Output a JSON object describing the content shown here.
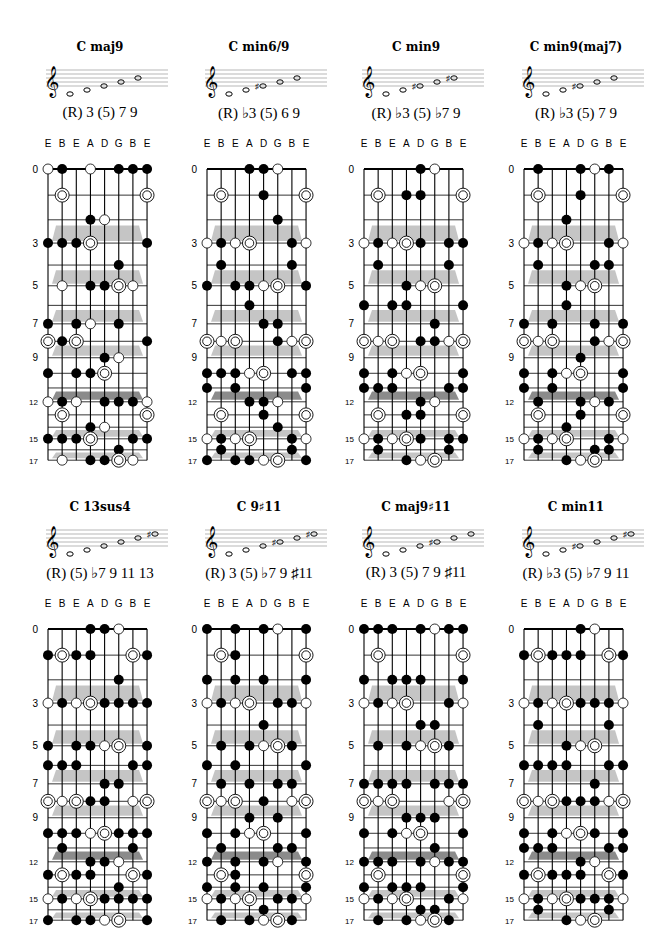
{
  "tuning": [
    "E",
    "B",
    "E",
    "A",
    "D",
    "G",
    "B",
    "E"
  ],
  "fret_labels": [
    0,
    3,
    5,
    7,
    9,
    12,
    15,
    17
  ],
  "legend": {
    "f": "filled-dot",
    "o": "open-circle",
    "r": "root-double-ring"
  },
  "charts": [
    {
      "title": "C maj9",
      "formula": "(R) 3 (5) 7 9",
      "notes": [
        0,
        1,
        2,
        3,
        4
      ],
      "acc": [
        0,
        0,
        0,
        0,
        0
      ],
      "dots": {
        "0": "of.o.fffo",
        "1": ".r.....r.",
        "2": "...fo....",
        "3": "fffr...ff",
        "4": ".....f...",
        "5": ".o.ffro..",
        "7": "f.fo.f..f",
        "8": "rfr....fr",
        "9": "....fo...",
        "10": "f.ffr...f",
        "12": "ofo.fffo",
        "13": ".r.....r",
        "14": "...fo...",
        "15": "fffr..ff",
        "16": ".....f..",
        "17": ".o.ffro."
      }
    },
    {
      "title": "C min6/9",
      "formula": "(R) ♭3 (5) 6 9",
      "notes": [
        0,
        1,
        2,
        3,
        4
      ],
      "acc": [
        0,
        0,
        1,
        0,
        0
      ],
      "dots": {
        "0": "...ffo..",
        "1": ".r..f..r",
        "2": ".....f..",
        "3": "ofor..fo",
        "4": ".f....f.",
        "5": "f.ffor.f",
        "6": "...f....",
        "7": "....ff..",
        "8": "ror..fo r",
        "10": "fffor.ff",
        "11": "f.f....f",
        "12": "...ffo..",
        "13": ".r..f..r",
        "14": ".....f..",
        "15": "ofor..fo",
        "16": ".f....f.",
        "17": "f.ffor.f"
      }
    },
    {
      "title": "C min9",
      "formula": "(R) ♭3 (5) ♭7 9",
      "notes": [
        0,
        1,
        2,
        3,
        4
      ],
      "acc": [
        0,
        0,
        1,
        0,
        1
      ],
      "dots": {
        "0": "....fo..",
        "1": ".r.ff..r",
        "3": "oforf.ffo",
        "4": ".f....f.",
        "5": "...for..",
        "6": "f.f f...f",
        "7": ".....f..",
        "8": "ror.ffor",
        "10": "f.for..f",
        "11": "fff...ff",
        "12": "....fo..",
        "13": ".r.ff..r",
        "15": "oforf.ffo",
        "16": ".f....f.",
        "17": "...for.."
      }
    },
    {
      "title": "C min9(maj7)",
      "formula": "(R) ♭3 (5) 7 9",
      "notes": [
        0,
        1,
        2,
        3,
        4
      ],
      "acc": [
        0,
        0,
        1,
        0,
        0
      ],
      "dots": {
        "0": ".f..fof.",
        "1": ".r..f..r",
        "2": "...f....",
        "3": "ofor..fo",
        "4": ".f...ff.",
        "5": "...for..",
        "6": "...f....",
        "7": "f.f..f.f",
        "8": "ror..for",
        "9": "....f...",
        "10": "f.for..f",
        "11": "f.f....f",
        "12": ".f..fof.",
        "13": ".r..f..r",
        "14": "...f....",
        "15": "ofor..fo",
        "16": ".f...ff.",
        "17": "...for.."
      }
    },
    {
      "title": "C 13sus4",
      "formula": "(R) (5) ♭7 9 11 13",
      "notes": [
        0,
        1,
        2,
        3,
        4,
        5
      ],
      "acc": [
        0,
        0,
        0,
        0,
        0,
        1
      ],
      "dots": {
        "0": "...ffo..",
        "1": "frff..rf",
        "2": ".....f..",
        "3": "oforffffo",
        "5": "f.ffor.f",
        "6": "fff...ff",
        "7": "....ff..",
        "8": "rorff.or",
        "10": "fffor fff",
        "11": ".f....f.",
        "12": "...ffo..",
        "13": "frff..rf",
        "14": ".....f..",
        "15": "oforffffo",
        "17": "f.ffor.f"
      }
    },
    {
      "title": "C 9♯11",
      "formula": "(R) 3 (5) ♭7 9 ♯11",
      "notes": [
        0,
        1,
        2,
        3,
        4,
        5
      ],
      "acc": [
        0,
        0,
        0,
        1,
        0,
        1
      ],
      "dots": {
        "0": "f.f.fo.f",
        "1": ".rf....r",
        "2": "f.f.f..f",
        "3": "ofor.ffo",
        "4": "....f...",
        "5": ".f.for f.",
        "6": "f.f....f",
        "7": ".f.f.ff.",
        "8": "ror.f.or",
        "9": "...f.f..",
        "10": "f.for..f",
        "11": ".f...ff.",
        "12": "f.f.fo.f",
        "13": ".rf....r",
        "14": "f.f.f..f",
        "15": "ofor.ffo",
        "16": "....f...",
        "17": ".f.forf."
      }
    },
    {
      "title": "C maj9♯11",
      "formula": "(R) 3 (5) 7 9 ♯11",
      "notes": [
        0,
        1,
        2,
        3,
        4,
        5
      ],
      "acc": [
        0,
        0,
        0,
        1,
        0,
        0
      ],
      "dots": {
        "0": "fff.foff",
        "1": ".r.....r",
        "2": "f.fff..f",
        "3": "ofor..fo",
        "4": "....ff..",
        "5": ".f.forf.",
        "7": "ffff.fff",
        "8": "ror...or",
        "9": "...fff..",
        "10": "f.for..f",
        "11": ".....f..",
        "12": "fff.foff",
        "13": ".r.....r",
        "14": "f.fff..f",
        "15": "ofor..fo",
        "16": "....ff..",
        "17": ".f.forf."
      }
    },
    {
      "title": "C min11",
      "formula": "(R) ♭3 (5) ♭7 9 11",
      "notes": [
        0,
        1,
        2,
        3,
        4,
        5
      ],
      "acc": [
        0,
        0,
        1,
        0,
        0,
        1
      ],
      "dots": {
        "0": "....fo..",
        "1": "frfff.rf",
        "3": "oforfffo",
        "4": ".f....f.",
        "5": "...for..",
        "6": "ffff..ff",
        "7": ".....f..",
        "8": "rorfffor",
        "10": "f.forf.f",
        "11": "fff...ff",
        "12": "....fo..",
        "13": "frfff.rf",
        "15": "oforfffo",
        "16": ".f....f.",
        "17": "...for.."
      }
    }
  ]
}
